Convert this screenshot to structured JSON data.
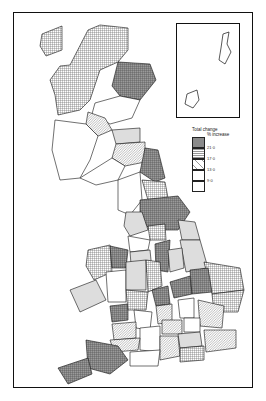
{
  "map": {
    "subject": "Great Britain regions/counties choropleth",
    "legend": {
      "title": "Total change",
      "subtitle": "% increase",
      "classes": [
        {
          "label": "21·0",
          "pattern": "dark-crosshatch",
          "fill": "#8a8a8a"
        },
        {
          "label": "17·0",
          "pattern": "grid",
          "fill": "#b8b8b8"
        },
        {
          "label": "13·0",
          "pattern": "diagonal",
          "fill": "#d8d8d8"
        },
        {
          "label": "9·0",
          "pattern": "vertical",
          "fill": "#ececec"
        },
        {
          "label": "",
          "pattern": "blank",
          "fill": "#ffffff"
        }
      ]
    },
    "inset": "Shetland and Orkney islands"
  }
}
